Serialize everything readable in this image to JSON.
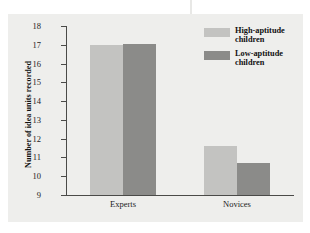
{
  "chart_data": {
    "type": "bar",
    "title": "",
    "subtitle": "",
    "xlabel": "",
    "ylabel": "Number of idea units recorded",
    "categories": [
      "Experts",
      "Novices"
    ],
    "series": [
      {
        "name": "High-aptitude children",
        "color": "#c3c3c1",
        "values": [
          17.0,
          11.6
        ]
      },
      {
        "name": "Low-aptitude children",
        "color": "#8b8b89",
        "values": [
          17.05,
          10.7
        ]
      }
    ],
    "ylim": [
      9,
      18
    ],
    "y_ticks": [
      18,
      17,
      16,
      15,
      14,
      13,
      12,
      11,
      10,
      9
    ],
    "y_tick_labels": [
      "18",
      "17",
      "16",
      "15",
      "14",
      "13",
      "12",
      "11",
      "10",
      "9"
    ],
    "grid": false,
    "legend_position": "top-right"
  },
  "axes": {
    "y_title": "Number of idea units recorded",
    "y_ticks": [
      "18",
      "17",
      "16",
      "15",
      "14",
      "13",
      "12",
      "11",
      "10",
      "9"
    ],
    "x_ticks": [
      "Experts",
      "Novices"
    ]
  },
  "legend": {
    "items": [
      {
        "label": "High-aptitude children",
        "swatch": "#c3c3c1"
      },
      {
        "label": "Low-aptitude children",
        "swatch": "#8b8b89"
      }
    ]
  },
  "colors": {
    "panel_background": "#eeeeec",
    "figure_background": "#ffffff",
    "axis": "#4a4a48",
    "text": "#111111",
    "series_light": "#c3c3c1",
    "series_dark": "#8b8b89"
  }
}
